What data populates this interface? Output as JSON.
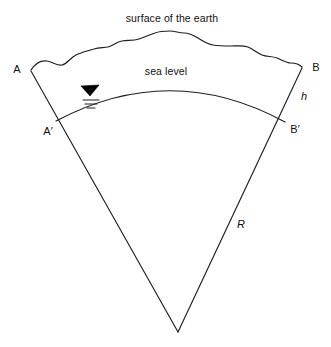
{
  "diagram": {
    "title_text": "surface of the earth",
    "sea_level_text": "sea level",
    "labels": {
      "a": "A",
      "b": "B",
      "a_prime": "A′",
      "b_prime": "B′",
      "h": "h",
      "r": "R"
    },
    "symbols": {
      "water_level": "water-level-triangle"
    },
    "colors": {
      "line": "#1f1f1f",
      "background": "#ffffff",
      "text": "#111111",
      "fill": "#000000"
    },
    "geometry": {
      "apex": [
        178,
        332
      ],
      "point_a": [
        28,
        69
      ],
      "point_b": [
        305,
        66
      ],
      "point_a_prime": [
        56,
        121
      ],
      "point_b_prime": [
        285,
        122
      ],
      "sea_level_arc_peak_y": 89,
      "terrain_peak_y": 31
    }
  }
}
